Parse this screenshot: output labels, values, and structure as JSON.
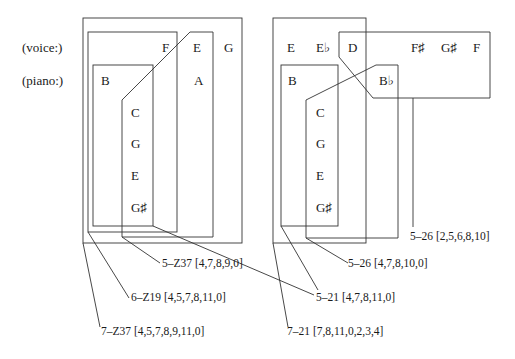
{
  "row_labels": {
    "voice": "(voice:)",
    "piano": "(piano:)"
  },
  "left_diagram": {
    "voice_notes": [
      "F",
      "E",
      "G"
    ],
    "piano_notes": [
      "B",
      "A"
    ],
    "column_notes": [
      "C",
      "G",
      "E",
      "G♯"
    ],
    "set_labels": [
      {
        "id": "5-Z37",
        "text": "5–Z37 [4,7,8,9,0]"
      },
      {
        "id": "6-Z19",
        "text": "6–Z19 [4,5,7,8,11,0]"
      },
      {
        "id": "7-Z37",
        "text": "7–Z37 [4,5,7,8,9,11,0]"
      }
    ]
  },
  "right_diagram": {
    "voice_notes": [
      "E",
      "E♭",
      "D",
      "F♯",
      "G♯",
      "F"
    ],
    "piano_notes": [
      "B",
      "B♭"
    ],
    "column_notes": [
      "C",
      "G",
      "E",
      "G♯"
    ],
    "set_labels": [
      {
        "id": "5-26a",
        "text": "5–26 [2,5,6,8,10]"
      },
      {
        "id": "5-26b",
        "text": "5–26 [4,7,8,10,0]"
      },
      {
        "id": "5-21",
        "text": "5–21 [4,7,8,11,0]"
      },
      {
        "id": "7-21",
        "text": "7–21 [7,8,11,0,2,3,4]"
      }
    ]
  }
}
